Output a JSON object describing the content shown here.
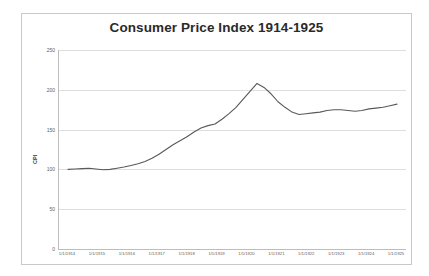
{
  "chart_data": {
    "type": "line",
    "title": "Consumer Price Index 1914-1925",
    "xlabel": "",
    "ylabel": "CPI",
    "ylim": [
      0,
      250
    ],
    "yticks": [
      0,
      50,
      100,
      150,
      200,
      250
    ],
    "grid": true,
    "legend": "none",
    "line_color": "#595959",
    "xticklabels": [
      "1/1/1914",
      "1/1/1915",
      "1/1/1916",
      "1/1/1917",
      "1/1/1918",
      "1/1/1919",
      "1/1/1920",
      "1/1/1921",
      "1/1/1922",
      "1/1/1923",
      "1/1/1924",
      "1/1/1925"
    ],
    "x": [
      "1/1/1914",
      "4/1/1914",
      "7/1/1914",
      "10/1/1914",
      "1/1/1915",
      "4/1/1915",
      "7/1/1915",
      "10/1/1915",
      "1/1/1916",
      "4/1/1916",
      "7/1/1916",
      "10/1/1916",
      "1/1/1917",
      "4/1/1917",
      "7/1/1917",
      "10/1/1917",
      "1/1/1918",
      "4/1/1918",
      "7/1/1918",
      "10/1/1918",
      "1/1/1919",
      "4/1/1919",
      "7/1/1919",
      "10/1/1919",
      "1/1/1920",
      "4/1/1920",
      "7/1/1920",
      "10/1/1920",
      "1/1/1921",
      "4/1/1921",
      "7/1/1921",
      "10/1/1921",
      "1/1/1922",
      "4/1/1922",
      "7/1/1922",
      "10/1/1922",
      "1/1/1923",
      "4/1/1923",
      "7/1/1923",
      "10/1/1923",
      "1/1/1924",
      "4/1/1924",
      "7/1/1924",
      "10/1/1924",
      "1/1/1925",
      "4/1/1925",
      "7/1/1925",
      "10/1/1925"
    ],
    "values": [
      100.0,
      100.5,
      101.0,
      101.5,
      100.5,
      99.5,
      100.0,
      101.5,
      103.0,
      105.0,
      107.0,
      110.0,
      114.0,
      119.0,
      125.0,
      131.0,
      136.0,
      141.0,
      147.0,
      152.0,
      155.0,
      157.0,
      163.0,
      170.0,
      178.0,
      188.0,
      198.0,
      208.0,
      203.0,
      195.0,
      185.0,
      178.0,
      172.0,
      169.0,
      170.0,
      171.0,
      172.0,
      174.0,
      175.0,
      175.0,
      174.0,
      173.0,
      174.0,
      176.0,
      177.0,
      178.0,
      180.0,
      182.0
    ],
    "notes": {
      "peak_value": 208,
      "peak_x": "10/1/1920",
      "start_value": 100,
      "end_value": 182
    }
  }
}
